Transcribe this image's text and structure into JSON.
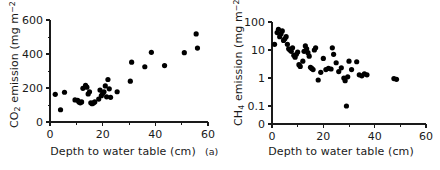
{
  "figure": {
    "background_color": "#ffffff",
    "marker_color": "#000000",
    "axis_color": "#1a1a1a"
  },
  "panels": [
    {
      "id": "a",
      "label": "(a)",
      "xlabel": "Depth to water table (cm)",
      "ylabel_html": "CO<sub>2</sub> emission (mg m<sup>&#8722;2</sup> h<sup>&#8722;1</sup>)",
      "ylabel_text": "CO2 emission (mg m-2 h-1)",
      "x_ticks": [
        "0",
        "20",
        "40",
        "60"
      ],
      "x_tick_values": [
        0,
        20,
        40,
        60
      ],
      "x_minor_values": [
        10,
        30,
        50
      ],
      "y_ticks": [
        "0",
        "200",
        "400",
        "600"
      ],
      "y_tick_values": [
        0,
        200,
        400,
        600
      ],
      "y_minor_values": [
        100,
        300,
        500
      ]
    },
    {
      "id": "b",
      "label": "(b)",
      "xlabel": "Depth to water table (cm)",
      "ylabel_html": "CH<sub>4</sub> emission (mg m<sup>&#8722;2</sup> d<sup>&#8722;1</sup>)",
      "ylabel_text": "CH4 emission (mg m-2 d-1)",
      "x_ticks": [
        "0",
        "20",
        "40",
        "60"
      ],
      "x_tick_values": [
        0,
        20,
        40,
        60
      ],
      "x_minor_values": [
        10,
        30,
        50
      ],
      "y_ticks": [
        "0",
        "0.1",
        "1",
        "10",
        "100"
      ],
      "y_tick_values": [
        0,
        0.1,
        1,
        10,
        100
      ],
      "y_minor_values": []
    }
  ],
  "chart_data": [
    {
      "type": "scatter",
      "panel": "(a)",
      "title": "",
      "xlabel": "Depth to water table (cm)",
      "ylabel": "CO2 emission (mg m-2 h-1)",
      "xlim": [
        0,
        60
      ],
      "ylim": [
        0,
        600
      ],
      "xscale": "linear",
      "yscale": "linear",
      "grid": false,
      "legend": "none",
      "x": [
        2.0,
        4.0,
        5.5,
        9.5,
        10.5,
        11.0,
        11.5,
        12.0,
        12.5,
        13.5,
        14.0,
        14.5,
        15.0,
        15.5,
        16.0,
        16.5,
        17.0,
        18.5,
        19.0,
        19.5,
        20.0,
        20.5,
        21.0,
        21.5,
        22.0,
        22.5,
        23.0,
        25.5,
        30.5,
        31.0,
        36.0,
        38.5,
        43.5,
        51.0,
        55.5,
        56.0
      ],
      "y": [
        163,
        72,
        175,
        130,
        128,
        118,
        113,
        118,
        198,
        215,
        205,
        165,
        178,
        113,
        108,
        112,
        118,
        135,
        188,
        155,
        168,
        178,
        212,
        148,
        250,
        195,
        145,
        178,
        240,
        352,
        325,
        410,
        332,
        408,
        518,
        435
      ]
    },
    {
      "type": "scatter",
      "panel": "(b)",
      "title": "",
      "xlabel": "Depth to water table (cm)",
      "ylabel": "CH4 emission (mg m-2 d-1)",
      "xlim": [
        0,
        60
      ],
      "ylim": [
        0.1,
        100
      ],
      "xscale": "linear",
      "yscale": "log",
      "grid": false,
      "legend": "none",
      "x": [
        1.0,
        2.0,
        2.5,
        3.0,
        3.5,
        4.0,
        4.5,
        5.0,
        5.5,
        6.0,
        6.5,
        7.0,
        7.5,
        8.0,
        8.5,
        9.0,
        9.5,
        10.0,
        10.5,
        11.0,
        12.0,
        12.5,
        13.0,
        13.5,
        14.0,
        14.5,
        15.0,
        15.5,
        16.0,
        16.5,
        17.0,
        18.0,
        19.0,
        20.0,
        21.0,
        22.0,
        23.0,
        23.5,
        24.0,
        25.0,
        26.0,
        27.0,
        28.0,
        28.5,
        29.0,
        29.5,
        30.0,
        31.0,
        33.0,
        34.0,
        35.0,
        36.0,
        37.0,
        47.5,
        48.5
      ],
      "y": [
        16,
        42,
        55,
        30,
        38,
        48,
        22,
        25,
        30,
        16,
        11,
        10,
        9,
        12,
        6.5,
        5.5,
        7.0,
        8.5,
        3.0,
        2.6,
        4.0,
        9.0,
        14,
        11,
        8.0,
        6.0,
        2.4,
        2.2,
        2.0,
        10,
        12,
        0.85,
        1.6,
        5.0,
        2.0,
        2.2,
        2.1,
        12,
        7.0,
        3.5,
        1.7,
        2.3,
        1.0,
        0.8,
        0.1,
        1.1,
        4.0,
        2.0,
        3.8,
        1.3,
        1.2,
        1.4,
        1.3,
        0.95,
        0.9
      ]
    }
  ]
}
